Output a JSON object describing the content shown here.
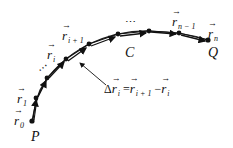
{
  "diagram": {
    "colors": {
      "curve": "#111111",
      "background": "#ffffff"
    },
    "points": [
      {
        "x": 32,
        "y": 121
      },
      {
        "x": 36,
        "y": 98
      },
      {
        "x": 47,
        "y": 78
      },
      {
        "x": 66,
        "y": 59
      },
      {
        "x": 89,
        "y": 44
      },
      {
        "x": 118,
        "y": 34
      },
      {
        "x": 149,
        "y": 31
      },
      {
        "x": 179,
        "y": 33
      },
      {
        "x": 208,
        "y": 40
      }
    ],
    "labels": {
      "r0": {
        "base": "r",
        "sub": "0"
      },
      "r1": {
        "base": "r",
        "sub": "1"
      },
      "ri": {
        "base": "r",
        "sub": "i"
      },
      "ri1": {
        "base": "r",
        "sub": "i + 1"
      },
      "rn1": {
        "base": "r",
        "sub": "n − 1"
      },
      "rn": {
        "base": "r",
        "sub": "n"
      },
      "start": "P",
      "end": "Q",
      "curve": "C",
      "ellipsis_lower": "⋯",
      "ellipsis_upper": "⋯",
      "delta": {
        "lhs_prefix": "Δ",
        "lhs_base": "r",
        "lhs_sub": "i",
        "equals": "=",
        "t1_base": "r",
        "t1_sub": "i + 1",
        "minus": "−",
        "t2_base": "r",
        "t2_sub": "i"
      }
    }
  }
}
